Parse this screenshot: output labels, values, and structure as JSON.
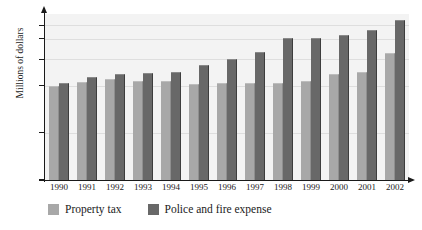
{
  "top_partial_text": "",
  "chart_data": {
    "type": "bar",
    "title": "",
    "xlabel": "",
    "ylabel": "Millions of dollars",
    "categories": [
      "1990",
      "1991",
      "1992",
      "1993",
      "1994",
      "1995",
      "1996",
      "1997",
      "1998",
      "1999",
      "2000",
      "2001",
      "2002"
    ],
    "series": [
      {
        "name": "Property tax",
        "color": "#a8a8a8",
        "values": [
          50,
          52,
          53.5,
          52.5,
          52.5,
          51,
          51.5,
          51.5,
          51.5,
          52.5,
          56,
          57,
          67.5
        ]
      },
      {
        "name": "Police and fire expense",
        "color": "#686868",
        "values": [
          51.5,
          54.5,
          56,
          56.5,
          57.5,
          61,
          64,
          68,
          75.5,
          75.5,
          77,
          79.5,
          85
        ]
      }
    ],
    "ylim": [
      0,
      88
    ],
    "yticks": [
      0,
      25,
      50,
      64,
      75,
      82
    ],
    "ytick_labels": [
      "0",
      "25",
      "50",
      "64",
      "75",
      "82"
    ],
    "grid": true,
    "gridlines_at": [
      25,
      50,
      64,
      75,
      82
    ],
    "legend_position": "bottom-left",
    "plot_background": "#f3f3f3",
    "axis_color": "#1a1a1a"
  }
}
